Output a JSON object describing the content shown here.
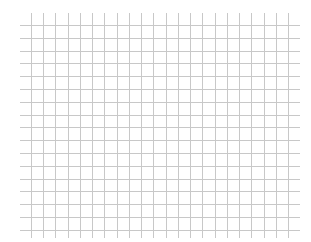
{
  "grid": {
    "background": "#ffffff",
    "line_color": "#c8c8c8",
    "vertical": {
      "count": 22,
      "x_start": 31,
      "spacing": 12.24,
      "y_top": 13,
      "y_bottom": 238
    },
    "horizontal": {
      "count": 17,
      "y_start": 25,
      "spacing": 12.8,
      "x_left": 20,
      "x_right": 300
    }
  }
}
